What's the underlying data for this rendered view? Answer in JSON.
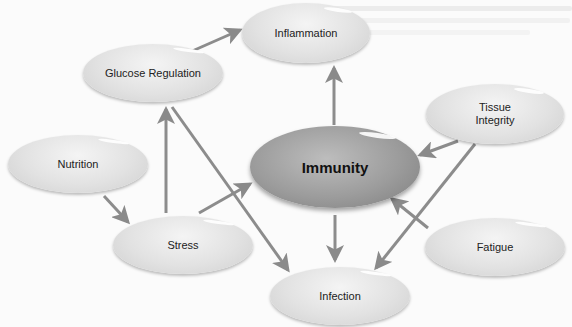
{
  "diagram": {
    "title": "",
    "nodes": [
      {
        "id": "inflammation",
        "label": "Inflammation"
      },
      {
        "id": "glucose",
        "label": "Glucose Regulation"
      },
      {
        "id": "tissue",
        "label": "Tissue\nIntegrity"
      },
      {
        "id": "nutrition",
        "label": "Nutrition"
      },
      {
        "id": "immunity",
        "label": "Immunity"
      },
      {
        "id": "stress",
        "label": "Stress"
      },
      {
        "id": "fatigue",
        "label": "Fatigue"
      },
      {
        "id": "infection",
        "label": "Infection"
      }
    ],
    "edges": [
      {
        "from": "glucose",
        "to": "inflammation"
      },
      {
        "from": "immunity",
        "to": "inflammation"
      },
      {
        "from": "tissue",
        "to": "immunity"
      },
      {
        "from": "tissue",
        "to": "infection"
      },
      {
        "from": "nutrition",
        "to": "stress"
      },
      {
        "from": "stress",
        "to": "glucose"
      },
      {
        "from": "stress",
        "to": "immunity"
      },
      {
        "from": "glucose",
        "to": "infection"
      },
      {
        "from": "immunity",
        "to": "infection"
      },
      {
        "from": "fatigue",
        "to": "immunity"
      }
    ],
    "colors": {
      "arrow": "#8a8a8a",
      "node": "#e0e0e0",
      "center_node": "#9c9c9c"
    }
  }
}
